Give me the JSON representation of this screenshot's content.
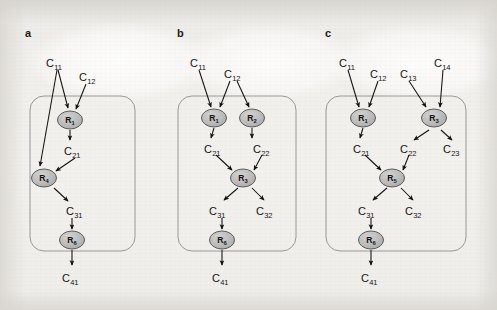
{
  "figure": {
    "panels": [
      {
        "letter": "a",
        "letter_pos": [
          25,
          27
        ],
        "box": {
          "x": 30,
          "y": 96,
          "w": 105,
          "h": 155,
          "rx": 14
        },
        "nodes": [
          {
            "id": "a-r1",
            "label": "R",
            "sub": "1",
            "cx": 70,
            "cy": 120,
            "rx": 12.5,
            "ry": 9
          },
          {
            "id": "a-r4",
            "label": "R",
            "sub": "4",
            "cx": 44,
            "cy": 178,
            "rx": 12.5,
            "ry": 9
          },
          {
            "id": "a-r6",
            "label": "R",
            "sub": "6",
            "cx": 72,
            "cy": 240,
            "rx": 12.5,
            "ry": 9
          }
        ],
        "species": [
          {
            "id": "a-c11",
            "base": "C",
            "sub": "11",
            "x": 46,
            "y": 57
          },
          {
            "id": "a-c12",
            "base": "C",
            "sub": "12",
            "x": 79,
            "y": 71
          },
          {
            "id": "a-c21",
            "base": "C",
            "sub": "21",
            "x": 64,
            "y": 145
          },
          {
            "id": "a-c31",
            "base": "C",
            "sub": "31",
            "x": 66,
            "y": 205
          },
          {
            "id": "a-c41",
            "base": "C",
            "sub": "41",
            "x": 62,
            "y": 272
          }
        ],
        "arrows": [
          [
            58,
            70,
            68,
            108
          ],
          [
            57,
            70,
            40,
            166
          ],
          [
            86,
            84,
            76,
            109
          ],
          [
            70,
            130,
            70,
            140
          ],
          [
            75,
            158,
            56,
            171
          ],
          [
            54,
            188,
            68,
            201
          ],
          [
            72,
            218,
            72,
            229
          ],
          [
            72,
            250,
            72,
            265
          ]
        ]
      },
      {
        "letter": "b",
        "letter_pos": [
          177,
          27
        ],
        "box": {
          "x": 178,
          "y": 96,
          "w": 118,
          "h": 155,
          "rx": 14
        },
        "nodes": [
          {
            "id": "b-r1",
            "label": "R",
            "sub": "1",
            "cx": 214,
            "cy": 118,
            "rx": 12.5,
            "ry": 9
          },
          {
            "id": "b-r2",
            "label": "R",
            "sub": "2",
            "cx": 252,
            "cy": 118,
            "rx": 12.5,
            "ry": 9
          },
          {
            "id": "b-r3",
            "label": "R",
            "sub": "3",
            "cx": 243,
            "cy": 178,
            "rx": 12.5,
            "ry": 9
          },
          {
            "id": "b-r6",
            "label": "R",
            "sub": "6",
            "cx": 222,
            "cy": 240,
            "rx": 12.5,
            "ry": 9
          }
        ],
        "species": [
          {
            "id": "b-c11",
            "base": "C",
            "sub": "11",
            "x": 190,
            "y": 57
          },
          {
            "id": "b-c12",
            "base": "C",
            "sub": "12",
            "x": 224,
            "y": 68
          },
          {
            "id": "b-c21",
            "base": "C",
            "sub": "21",
            "x": 204,
            "y": 143
          },
          {
            "id": "b-c22",
            "base": "C",
            "sub": "22",
            "x": 253,
            "y": 143
          },
          {
            "id": "b-c31",
            "base": "C",
            "sub": "31",
            "x": 209,
            "y": 205
          },
          {
            "id": "b-c32",
            "base": "C",
            "sub": "32",
            "x": 256,
            "y": 205
          },
          {
            "id": "b-c41",
            "base": "C",
            "sub": "41",
            "x": 212,
            "y": 272
          }
        ],
        "arrows": [
          [
            199,
            70,
            211,
            107
          ],
          [
            230,
            81,
            220,
            107
          ],
          [
            237,
            81,
            249,
            107
          ],
          [
            214,
            128,
            211,
            138
          ],
          [
            252,
            128,
            252,
            138
          ],
          [
            216,
            155,
            232,
            170
          ],
          [
            262,
            155,
            254,
            170
          ],
          [
            238,
            188,
            224,
            200
          ],
          [
            252,
            188,
            264,
            200
          ],
          [
            222,
            218,
            222,
            229
          ],
          [
            222,
            250,
            222,
            265
          ]
        ]
      },
      {
        "letter": "c",
        "letter_pos": [
          325,
          27
        ],
        "box": {
          "x": 326,
          "y": 96,
          "w": 140,
          "h": 155,
          "rx": 14
        },
        "nodes": [
          {
            "id": "c-r1",
            "label": "R",
            "sub": "1",
            "cx": 363,
            "cy": 118,
            "rx": 12.5,
            "ry": 9
          },
          {
            "id": "c-r3",
            "label": "R",
            "sub": "3",
            "cx": 434,
            "cy": 118,
            "rx": 12.5,
            "ry": 9
          },
          {
            "id": "c-r5",
            "label": "R",
            "sub": "5",
            "cx": 392,
            "cy": 178,
            "rx": 12.5,
            "ry": 9
          },
          {
            "id": "c-r6",
            "label": "R",
            "sub": "6",
            "cx": 371,
            "cy": 240,
            "rx": 12.5,
            "ry": 9
          }
        ],
        "species": [
          {
            "id": "c-c11",
            "base": "C",
            "sub": "11",
            "x": 339,
            "y": 57
          },
          {
            "id": "c-c12",
            "base": "C",
            "sub": "12",
            "x": 370,
            "y": 68
          },
          {
            "id": "c-c13",
            "base": "C",
            "sub": "13",
            "x": 400,
            "y": 68
          },
          {
            "id": "c-c14",
            "base": "C",
            "sub": "14",
            "x": 434,
            "y": 57
          },
          {
            "id": "c-c21",
            "base": "C",
            "sub": "21",
            "x": 353,
            "y": 143
          },
          {
            "id": "c-c22",
            "base": "C",
            "sub": "22",
            "x": 400,
            "y": 143
          },
          {
            "id": "c-c23",
            "base": "C",
            "sub": "23",
            "x": 443,
            "y": 143
          },
          {
            "id": "c-c31",
            "base": "C",
            "sub": "31",
            "x": 358,
            "y": 205
          },
          {
            "id": "c-c32",
            "base": "C",
            "sub": "32",
            "x": 405,
            "y": 205
          },
          {
            "id": "c-c41",
            "base": "C",
            "sub": "41",
            "x": 361,
            "y": 272
          }
        ],
        "arrows": [
          [
            348,
            70,
            359,
            107
          ],
          [
            378,
            81,
            369,
            107
          ],
          [
            409,
            81,
            426,
            107
          ],
          [
            443,
            70,
            440,
            107
          ],
          [
            363,
            128,
            360,
            138
          ],
          [
            429,
            130,
            414,
            140
          ],
          [
            441,
            130,
            452,
            140
          ],
          [
            365,
            155,
            381,
            170
          ],
          [
            409,
            155,
            403,
            170
          ],
          [
            387,
            188,
            373,
            200
          ],
          [
            401,
            188,
            413,
            200
          ],
          [
            371,
            218,
            371,
            229
          ],
          [
            371,
            250,
            371,
            265
          ]
        ]
      }
    ],
    "style": {
      "node_fill": "#b9b9b9",
      "node_stroke": "#4d4d4d",
      "box_stroke": "#8e8e8e",
      "arrow_color": "#111111",
      "label_color": "#141414",
      "background": "#f2f0ec"
    }
  }
}
